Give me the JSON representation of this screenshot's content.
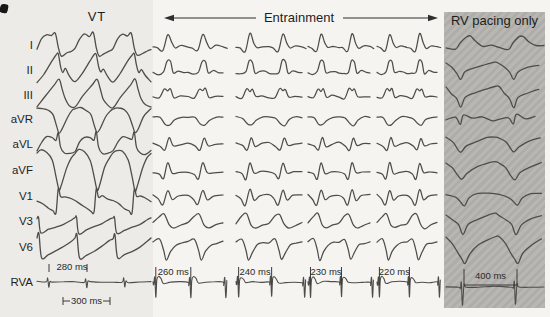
{
  "header": {
    "vt_label": "VT",
    "entrainment_label": "Entrainment",
    "rv_label": "RV pacing only"
  },
  "colors": {
    "ink": "#4f4d49",
    "text": "#1f1f1f",
    "annotation": "#2a2a2a",
    "tick": "#3a3a3a",
    "shade": "#b5b3af",
    "background": "#f5f4f1"
  },
  "leads": [
    {
      "label": "I",
      "y": 45
    },
    {
      "label": "II",
      "y": 70
    },
    {
      "label": "III",
      "y": 95
    },
    {
      "label": "aVR",
      "y": 119
    },
    {
      "label": "aVL",
      "y": 144
    },
    {
      "label": "aVF",
      "y": 170
    },
    {
      "label": "V1",
      "y": 196
    },
    {
      "label": "V3",
      "y": 221
    },
    {
      "label": "V6",
      "y": 247
    },
    {
      "label": "RVA",
      "y": 282
    }
  ],
  "sections": {
    "vt": {
      "x": 37,
      "beat_w": 38,
      "beats": 3,
      "rva_cycle_label": "280 ms",
      "bracket_label": "300 ms"
    },
    "entrainment": {
      "beats": 2.12,
      "groups": [
        {
          "x": 153,
          "beat_w": 35,
          "cycle_label": "260 ms"
        },
        {
          "x": 236,
          "beat_w": 33,
          "cycle_label": "240 ms"
        },
        {
          "x": 308,
          "beat_w": 31,
          "cycle_label": "230 ms"
        },
        {
          "x": 377,
          "beat_w": 30,
          "cycle_label": "220 ms"
        }
      ]
    },
    "rv": {
      "x": 446,
      "beat_w": 53,
      "beats": 1.87,
      "cycle_label": "400 ms",
      "box": {
        "x": 444,
        "y": 12,
        "w": 101,
        "h": 296
      }
    }
  },
  "waveforms": {
    "vt": {
      "I": [
        [
          0,
          4
        ],
        [
          0.12,
          -6
        ],
        [
          0.25,
          -11
        ],
        [
          0.38,
          -9
        ],
        [
          0.48,
          -12
        ],
        [
          0.56,
          3
        ],
        [
          0.64,
          11
        ],
        [
          0.78,
          8
        ],
        [
          0.9,
          6
        ],
        [
          1,
          4
        ]
      ],
      "II": [
        [
          0,
          12
        ],
        [
          0.18,
          4
        ],
        [
          0.38,
          -8
        ],
        [
          0.5,
          -15
        ],
        [
          0.56,
          -16
        ],
        [
          0.62,
          -4
        ],
        [
          0.68,
          2
        ],
        [
          0.75,
          -1
        ],
        [
          0.85,
          6
        ],
        [
          1,
          12
        ]
      ],
      "III": [
        [
          0,
          12
        ],
        [
          0.2,
          2
        ],
        [
          0.45,
          -10
        ],
        [
          0.58,
          -16
        ],
        [
          0.66,
          -6
        ],
        [
          0.74,
          4
        ],
        [
          0.85,
          10
        ],
        [
          1,
          12
        ]
      ],
      "aVR": [
        [
          0,
          -10
        ],
        [
          0.15,
          -11
        ],
        [
          0.3,
          -9
        ],
        [
          0.42,
          -4
        ],
        [
          0.52,
          8
        ],
        [
          0.58,
          14
        ],
        [
          0.66,
          10
        ],
        [
          0.8,
          -2
        ],
        [
          0.92,
          -8
        ],
        [
          1,
          -10
        ]
      ],
      "aVL": [
        [
          0,
          7
        ],
        [
          0.12,
          -2
        ],
        [
          0.25,
          -7
        ],
        [
          0.4,
          -6
        ],
        [
          0.5,
          -4
        ],
        [
          0.56,
          -12
        ],
        [
          0.62,
          3
        ],
        [
          0.72,
          9
        ],
        [
          0.85,
          10
        ],
        [
          1,
          7
        ]
      ],
      "aVF": [
        [
          0,
          -17
        ],
        [
          0.1,
          -20
        ],
        [
          0.25,
          -18
        ],
        [
          0.4,
          -10
        ],
        [
          0.5,
          6
        ],
        [
          0.58,
          20
        ],
        [
          0.64,
          16
        ],
        [
          0.78,
          -2
        ],
        [
          0.9,
          -12
        ],
        [
          1,
          -17
        ]
      ],
      "V1": [
        [
          0,
          5
        ],
        [
          0.15,
          8
        ],
        [
          0.3,
          12
        ],
        [
          0.42,
          15
        ],
        [
          0.5,
          17
        ],
        [
          0.56,
          -7
        ],
        [
          0.62,
          1
        ],
        [
          0.72,
          0
        ],
        [
          0.85,
          2
        ],
        [
          1,
          5
        ]
      ],
      "V3": [
        [
          0,
          -3
        ],
        [
          0.04,
          -4
        ],
        [
          0.1,
          12
        ],
        [
          0.3,
          9
        ],
        [
          0.5,
          6
        ],
        [
          0.7,
          3
        ],
        [
          0.9,
          -1
        ],
        [
          1,
          -3
        ]
      ],
      "V6": [
        [
          0,
          -9
        ],
        [
          0.05,
          -13
        ],
        [
          0.12,
          11
        ],
        [
          0.3,
          8
        ],
        [
          0.5,
          4
        ],
        [
          0.7,
          0
        ],
        [
          0.9,
          -6
        ],
        [
          1,
          -9
        ]
      ],
      "RVA": [
        [
          0,
          0
        ],
        [
          0.24,
          0
        ],
        [
          0.28,
          -4
        ],
        [
          0.31,
          5
        ],
        [
          0.34,
          -1
        ],
        [
          0.4,
          0
        ],
        [
          0.7,
          0
        ],
        [
          1,
          0
        ]
      ]
    },
    "ent": {
      "I": [
        [
          0,
          2
        ],
        [
          0.12,
          3
        ],
        [
          0.28,
          6
        ],
        [
          0.42,
          -11
        ],
        [
          0.54,
          -2
        ],
        [
          0.64,
          3
        ],
        [
          0.8,
          1
        ],
        [
          1,
          2
        ]
      ],
      "II": [
        [
          0,
          3
        ],
        [
          0.15,
          4
        ],
        [
          0.3,
          2
        ],
        [
          0.4,
          -9
        ],
        [
          0.5,
          -8
        ],
        [
          0.58,
          3
        ],
        [
          0.72,
          1
        ],
        [
          0.88,
          2
        ],
        [
          1,
          3
        ]
      ],
      "III": [
        [
          0,
          2
        ],
        [
          0.18,
          3
        ],
        [
          0.32,
          -6
        ],
        [
          0.42,
          -4
        ],
        [
          0.5,
          -6
        ],
        [
          0.6,
          2
        ],
        [
          0.78,
          1
        ],
        [
          1,
          2
        ]
      ],
      "aVR": [
        [
          0,
          -2
        ],
        [
          0.2,
          -1
        ],
        [
          0.35,
          5
        ],
        [
          0.48,
          6
        ],
        [
          0.62,
          1
        ],
        [
          0.82,
          -2
        ],
        [
          1,
          -2
        ]
      ],
      "aVL": [
        [
          0,
          -1
        ],
        [
          0.2,
          2
        ],
        [
          0.34,
          6
        ],
        [
          0.46,
          -6
        ],
        [
          0.58,
          2
        ],
        [
          0.78,
          0
        ],
        [
          1,
          -1
        ]
      ],
      "aVF": [
        [
          0,
          2
        ],
        [
          0.18,
          4
        ],
        [
          0.3,
          9
        ],
        [
          0.42,
          -7
        ],
        [
          0.55,
          3
        ],
        [
          0.75,
          2
        ],
        [
          1,
          2
        ]
      ],
      "V1": [
        [
          0,
          -1
        ],
        [
          0.15,
          3
        ],
        [
          0.28,
          9
        ],
        [
          0.42,
          -6
        ],
        [
          0.55,
          4
        ],
        [
          0.72,
          0
        ],
        [
          1,
          -1
        ]
      ],
      "V3": [
        [
          0,
          2
        ],
        [
          0.18,
          -5
        ],
        [
          0.32,
          -7
        ],
        [
          0.46,
          4
        ],
        [
          0.6,
          7
        ],
        [
          0.8,
          4
        ],
        [
          1,
          2
        ]
      ],
      "V6": [
        [
          0,
          -5
        ],
        [
          0.18,
          -8
        ],
        [
          0.3,
          3
        ],
        [
          0.38,
          13
        ],
        [
          0.5,
          5
        ],
        [
          0.65,
          -2
        ],
        [
          0.82,
          -4
        ],
        [
          1,
          -5
        ]
      ],
      "RVA": [
        [
          0,
          0
        ],
        [
          0.02,
          3
        ],
        [
          0.05,
          -5
        ],
        [
          0.08,
          15
        ],
        [
          0.11,
          -2
        ],
        [
          0.16,
          -5
        ],
        [
          0.23,
          -3
        ],
        [
          0.3,
          1
        ],
        [
          0.5,
          0
        ],
        [
          0.75,
          0
        ],
        [
          1,
          0
        ]
      ]
    },
    "rv": {
      "I": [
        [
          0,
          2
        ],
        [
          0.18,
          4
        ],
        [
          0.27,
          -2
        ],
        [
          0.38,
          -8
        ],
        [
          0.46,
          -9
        ],
        [
          0.56,
          -3
        ],
        [
          0.7,
          1
        ],
        [
          0.85,
          0
        ],
        [
          1,
          2
        ]
      ],
      "II": [
        [
          0,
          -7
        ],
        [
          0.1,
          -3
        ],
        [
          0.2,
          3
        ],
        [
          0.28,
          9
        ],
        [
          0.36,
          2
        ],
        [
          0.55,
          -2
        ],
        [
          0.75,
          -5
        ],
        [
          0.92,
          -8
        ],
        [
          1,
          -7
        ]
      ],
      "III": [
        [
          0,
          -8
        ],
        [
          0.1,
          -2
        ],
        [
          0.2,
          4
        ],
        [
          0.28,
          12
        ],
        [
          0.36,
          3
        ],
        [
          0.55,
          -2
        ],
        [
          0.75,
          -6
        ],
        [
          0.92,
          -9
        ],
        [
          1,
          -8
        ]
      ],
      "aVR": [
        [
          0,
          1
        ],
        [
          0.18,
          -1
        ],
        [
          0.27,
          5
        ],
        [
          0.33,
          -4
        ],
        [
          0.5,
          0
        ],
        [
          0.68,
          -2
        ],
        [
          0.88,
          2
        ],
        [
          1,
          1
        ]
      ],
      "aVL": [
        [
          0,
          -6
        ],
        [
          0.14,
          -1
        ],
        [
          0.27,
          8
        ],
        [
          0.38,
          2
        ],
        [
          0.58,
          -3
        ],
        [
          0.78,
          -6
        ],
        [
          0.93,
          -7
        ],
        [
          1,
          -6
        ]
      ],
      "aVF": [
        [
          0,
          -7
        ],
        [
          0.12,
          -2
        ],
        [
          0.22,
          5
        ],
        [
          0.3,
          10
        ],
        [
          0.4,
          3
        ],
        [
          0.6,
          -3
        ],
        [
          0.8,
          -7
        ],
        [
          0.93,
          -8
        ],
        [
          1,
          -7
        ]
      ],
      "V1": [
        [
          0,
          -2
        ],
        [
          0.18,
          1
        ],
        [
          0.27,
          6
        ],
        [
          0.35,
          9
        ],
        [
          0.44,
          2
        ],
        [
          0.6,
          -2
        ],
        [
          0.8,
          -3
        ],
        [
          1,
          -2
        ]
      ],
      "V3": [
        [
          0,
          -6
        ],
        [
          0.14,
          -1
        ],
        [
          0.24,
          4
        ],
        [
          0.32,
          13
        ],
        [
          0.42,
          4
        ],
        [
          0.6,
          -2
        ],
        [
          0.8,
          -6
        ],
        [
          0.93,
          -8
        ],
        [
          1,
          -6
        ]
      ],
      "V6": [
        [
          0,
          -10
        ],
        [
          0.12,
          -4
        ],
        [
          0.22,
          6
        ],
        [
          0.3,
          12
        ],
        [
          0.36,
          17
        ],
        [
          0.45,
          6
        ],
        [
          0.6,
          -2
        ],
        [
          0.8,
          -8
        ],
        [
          0.94,
          -11
        ],
        [
          1,
          -10
        ]
      ],
      "RVA": [
        [
          0,
          5
        ],
        [
          0.24,
          5
        ],
        [
          0.27,
          6
        ],
        [
          0.29,
          0
        ],
        [
          0.31,
          23
        ],
        [
          0.34,
          3
        ],
        [
          0.38,
          5
        ],
        [
          0.6,
          5
        ],
        [
          0.85,
          5
        ],
        [
          1,
          5
        ]
      ]
    }
  },
  "chart_data": {
    "type": "line",
    "title": "",
    "leads": [
      "I",
      "II",
      "III",
      "aVR",
      "aVL",
      "aVF",
      "V1",
      "V3",
      "V6",
      "RVA"
    ],
    "sections": [
      {
        "name": "VT",
        "rva_cycle_length_ms": 280,
        "bracket_interval_ms": 300,
        "beats_shown": 3
      },
      {
        "name": "Entrainment",
        "paced_cycle_lengths_ms": [
          260,
          240,
          230,
          220
        ],
        "beats_shown_per_group": 2
      },
      {
        "name": "RV pacing only",
        "paced_cycle_length_ms": 400,
        "beats_shown": 2,
        "highlighted": true
      }
    ],
    "legend_position": "none",
    "grid": false
  }
}
